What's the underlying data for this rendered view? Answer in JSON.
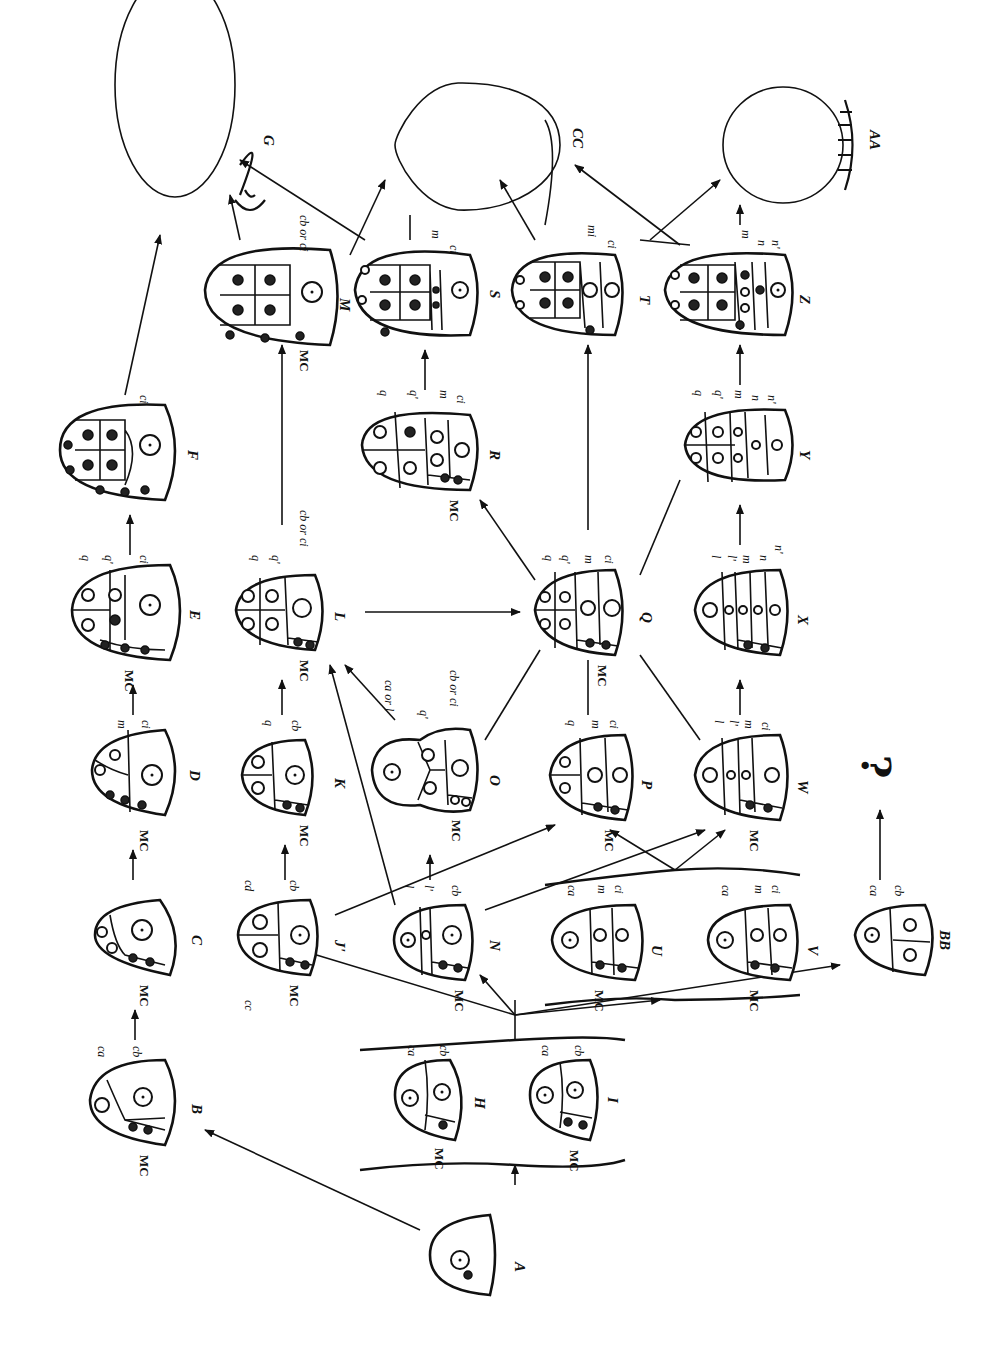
{
  "figure": {
    "orientation": "rotated 90 degrees clockwise",
    "unknown_marker": "?"
  },
  "stages": [
    {
      "id": "A",
      "label": "A",
      "x": 470,
      "y": 1250,
      "cells": []
    },
    {
      "id": "B",
      "label": "B",
      "x": 145,
      "y": 1100,
      "cells": [
        "ca",
        "cb",
        "MC"
      ]
    },
    {
      "id": "C",
      "label": "C",
      "x": 140,
      "y": 935,
      "cells": [
        "MC"
      ]
    },
    {
      "id": "D",
      "label": "D",
      "x": 125,
      "y": 775,
      "cells": [
        "m",
        "ci",
        "MC"
      ]
    },
    {
      "id": "E",
      "label": "E",
      "x": 105,
      "y": 610,
      "cells": [
        "q",
        "q'",
        "ci",
        "MC"
      ]
    },
    {
      "id": "F",
      "label": "F",
      "x": 105,
      "y": 450,
      "cells": [
        "ci"
      ]
    },
    {
      "id": "G",
      "label": "G",
      "x": 175,
      "y": 115,
      "cells": []
    },
    {
      "id": "H",
      "label": "H",
      "x": 435,
      "y": 1095,
      "cells": [
        "ca",
        "cb",
        "MC"
      ]
    },
    {
      "id": "I",
      "label": "I",
      "x": 570,
      "y": 1095,
      "cells": [
        "ca",
        "cb",
        "MC"
      ]
    },
    {
      "id": "J",
      "label": "J'",
      "x": 265,
      "y": 935,
      "cells": [
        "cd",
        "cc",
        "cb",
        "MC"
      ]
    },
    {
      "id": "K",
      "label": "K",
      "x": 265,
      "y": 775,
      "cells": [
        "q",
        "cb",
        "MC"
      ]
    },
    {
      "id": "L",
      "label": "L",
      "x": 265,
      "y": 610,
      "cells": [
        "q",
        "q'",
        "cb or ci",
        "MC"
      ]
    },
    {
      "id": "M",
      "label": "M",
      "x": 255,
      "y": 295,
      "cells": [
        "cb or ci",
        "MC"
      ]
    },
    {
      "id": "N",
      "label": "N",
      "x": 420,
      "y": 940,
      "cells": [
        "l",
        "l'",
        "cb",
        "MC"
      ]
    },
    {
      "id": "O",
      "label": "O",
      "x": 405,
      "y": 770,
      "cells": [
        "ca or l",
        "q'",
        "cb or ci",
        "MC"
      ]
    },
    {
      "id": "P",
      "label": "P",
      "x": 580,
      "y": 775,
      "cells": [
        "q",
        "m",
        "ci",
        "MC"
      ]
    },
    {
      "id": "Q",
      "label": "Q",
      "x": 565,
      "y": 610,
      "cells": [
        "q",
        "q'",
        "m",
        "ci",
        "MC"
      ]
    },
    {
      "id": "R",
      "label": "R",
      "x": 400,
      "y": 445,
      "cells": [
        "q",
        "q'",
        "m",
        "ci",
        "MC"
      ]
    },
    {
      "id": "S",
      "label": "S",
      "x": 400,
      "y": 290,
      "cells": [
        "m",
        "ci"
      ]
    },
    {
      "id": "T",
      "label": "T",
      "x": 555,
      "y": 290,
      "cells": [
        "mi",
        "ci"
      ]
    },
    {
      "id": "U",
      "label": "U",
      "x": 590,
      "y": 940,
      "cells": [
        "ca",
        "m",
        "ci",
        "MC"
      ]
    },
    {
      "id": "V",
      "label": "V",
      "x": 745,
      "y": 940,
      "cells": [
        "ca",
        "m",
        "ci",
        "MC"
      ]
    },
    {
      "id": "W",
      "label": "W",
      "x": 735,
      "y": 775,
      "cells": [
        "l",
        "l'",
        "m",
        "ci",
        "MC"
      ]
    },
    {
      "id": "X",
      "label": "X",
      "x": 725,
      "y": 610,
      "cells": [
        "l",
        "l'",
        "m",
        "n",
        "n'"
      ]
    },
    {
      "id": "Y",
      "label": "Y",
      "x": 720,
      "y": 445,
      "cells": [
        "q",
        "q'",
        "m",
        "n",
        "n'"
      ]
    },
    {
      "id": "Z",
      "label": "Z",
      "x": 720,
      "y": 290,
      "cells": [
        "m",
        "n",
        "n'"
      ]
    },
    {
      "id": "AA",
      "label": "AA",
      "x": 770,
      "y": 115,
      "cells": []
    },
    {
      "id": "BB",
      "label": "BB",
      "x": 880,
      "y": 935,
      "cells": [
        "ca",
        "cb"
      ]
    },
    {
      "id": "CC",
      "label": "CC",
      "x": 460,
      "y": 115,
      "cells": []
    }
  ],
  "transitions": [
    {
      "from": "A",
      "to": "B"
    },
    {
      "from": "A",
      "to": "H/I"
    },
    {
      "from": "B",
      "to": "C"
    },
    {
      "from": "C",
      "to": "D"
    },
    {
      "from": "D",
      "to": "E"
    },
    {
      "from": "E",
      "to": "F"
    },
    {
      "from": "F",
      "to": "G"
    },
    {
      "from": "H/I",
      "to": "J'"
    },
    {
      "from": "H/I",
      "to": "N"
    },
    {
      "from": "H/I",
      "to": "U/V"
    },
    {
      "from": "H/I",
      "to": "BB"
    },
    {
      "from": "J'",
      "to": "K"
    },
    {
      "from": "J'",
      "to": "P"
    },
    {
      "from": "K",
      "to": "L"
    },
    {
      "from": "L",
      "to": "M"
    },
    {
      "from": "L",
      "to": "Q"
    },
    {
      "from": "M",
      "to": "G"
    },
    {
      "from": "M",
      "to": "CC"
    },
    {
      "from": "N",
      "to": "O"
    },
    {
      "from": "N",
      "to": "L"
    },
    {
      "from": "N",
      "to": "W"
    },
    {
      "from": "O",
      "to": "L"
    },
    {
      "from": "O",
      "to": "Q"
    },
    {
      "from": "P",
      "to": "Q"
    },
    {
      "from": "U/V",
      "to": "P"
    },
    {
      "from": "U/V",
      "to": "W"
    },
    {
      "from": "Q",
      "to": "R"
    },
    {
      "from": "Q",
      "to": "T"
    },
    {
      "from": "Q",
      "to": "Y"
    },
    {
      "from": "R",
      "to": "S"
    },
    {
      "from": "S",
      "to": "G"
    },
    {
      "from": "S",
      "to": "CC"
    },
    {
      "from": "T",
      "to": "CC"
    },
    {
      "from": "T",
      "to": "AA"
    },
    {
      "from": "W",
      "to": "Q"
    },
    {
      "from": "W",
      "to": "X"
    },
    {
      "from": "X",
      "to": "Y"
    },
    {
      "from": "Y",
      "to": "Z"
    },
    {
      "from": "Z",
      "to": "AA"
    },
    {
      "from": "Z",
      "to": "CC"
    },
    {
      "from": "BB",
      "to": "?"
    }
  ],
  "labels": {
    "A": "A",
    "B": "B",
    "C": "C",
    "D": "D",
    "E": "E",
    "F": "F",
    "G": "G",
    "H": "H",
    "I": "I",
    "J": "J'",
    "K": "K",
    "L": "L",
    "M": "M",
    "N": "N",
    "O": "O",
    "P": "P",
    "Q": "Q",
    "R": "R",
    "S": "S",
    "T": "T",
    "U": "U",
    "V": "V",
    "W": "W",
    "X": "X",
    "Y": "Y",
    "Z": "Z",
    "AA": "AA",
    "BB": "BB",
    "CC": "CC",
    "MC": "MC",
    "ca": "ca",
    "cb": "cb",
    "cc": "cc",
    "cd": "cd",
    "ci": "ci",
    "m": "m",
    "mi": "mi",
    "q": "q",
    "q_prime": "q'",
    "l": "l",
    "l_prime": "l'",
    "n": "n",
    "n_prime": "n'",
    "cb_or_ci": "cb or ci",
    "ca_or_l": "ca or l",
    "question": "?"
  }
}
